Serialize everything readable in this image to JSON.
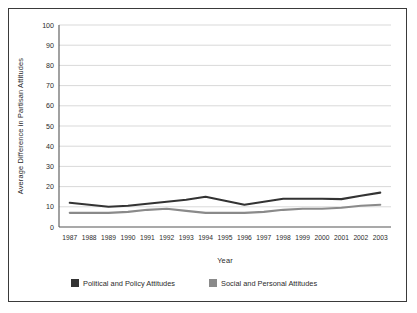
{
  "figure": {
    "border_color": "#3a3a3a",
    "background": "#ffffff"
  },
  "chart_data": {
    "type": "line",
    "title": "",
    "xlabel": "Year",
    "ylabel": "Average  Difference in Partisan Attitudes",
    "categories": [
      "1987",
      "1988",
      "1989",
      "1990",
      "1991",
      "1992",
      "1993",
      "1994",
      "1995",
      "1996",
      "1997",
      "1998",
      "1999",
      "2000",
      "2001",
      "2002",
      "2003"
    ],
    "ylim": [
      0,
      100
    ],
    "yticks": [
      0,
      10,
      20,
      30,
      40,
      50,
      60,
      70,
      80,
      90,
      100
    ],
    "ytick_labels": [
      "0",
      "10",
      "20",
      "30",
      "40",
      "50",
      "60",
      "70",
      "80",
      "90",
      "100"
    ],
    "grid": true,
    "grid_axis": "y",
    "grid_color": "#c9c9c9",
    "legend_position": "bottom",
    "series": [
      {
        "name": "Political and Policy Attitudes",
        "color": "#333333",
        "line_width": 2.1,
        "values": [
          12,
          11,
          10,
          10.5,
          11.5,
          12.5,
          13.5,
          15,
          13,
          11,
          12.5,
          14,
          14,
          14,
          13.8,
          15.5,
          17
        ]
      },
      {
        "name": "Social and Personal Attitudes",
        "color": "#8a8a8a",
        "line_width": 2.1,
        "values": [
          7,
          7,
          7,
          7.5,
          8.5,
          9,
          8,
          7,
          7,
          7,
          7.5,
          8.5,
          9,
          9,
          9.5,
          10.5,
          11
        ]
      }
    ]
  },
  "legend": {
    "items": [
      {
        "label": "Political and Policy Attitudes",
        "swatch_color": "#333333"
      },
      {
        "label": "Social and Personal Attitudes",
        "swatch_color": "#8a8a8a"
      }
    ]
  }
}
